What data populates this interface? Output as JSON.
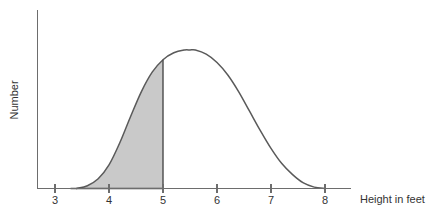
{
  "chart_data": {
    "type": "area",
    "title": "",
    "subtitle": "",
    "xlabel": "Height in feet",
    "ylabel": "Number",
    "x_ticks": [
      3,
      4,
      5,
      6,
      7,
      8
    ],
    "x_tick_labels": [
      "3",
      "4",
      "5",
      "6",
      "7",
      "8"
    ],
    "xlim": [
      2.6,
      8.5
    ],
    "ylim": [
      0,
      1.12
    ],
    "y_ticks": [],
    "y_tick_labels": [],
    "grid": false,
    "legend": null,
    "annotations": [],
    "series": [
      {
        "name": "Height distribution",
        "description": "Bell-shaped normal-like distribution of heights",
        "peak_x": 5.5,
        "peak_y": 1.0,
        "left_tail_x": 3.5,
        "right_tail_x": 7.85,
        "x": [
          3.4,
          3.6,
          3.8,
          4.0,
          4.2,
          4.4,
          4.6,
          4.8,
          5.0,
          5.2,
          5.4,
          5.5,
          5.6,
          5.8,
          6.0,
          6.2,
          6.4,
          6.6,
          6.8,
          7.0,
          7.2,
          7.4,
          7.6,
          7.8,
          8.0
        ],
        "y": [
          0.0,
          0.02,
          0.07,
          0.17,
          0.33,
          0.52,
          0.7,
          0.84,
          0.93,
          0.98,
          1.0,
          1.0,
          1.0,
          0.97,
          0.91,
          0.82,
          0.7,
          0.56,
          0.42,
          0.29,
          0.18,
          0.1,
          0.04,
          0.01,
          0.0
        ]
      }
    ],
    "shaded_area": {
      "label": "shaded region",
      "from_x": 3.4,
      "to_x": 5.0,
      "color": "#c9c9c9",
      "boundary_x": 5.0
    },
    "colors": {
      "curve": "#5a5a5a",
      "axis": "#6d6d6d",
      "shade_fill": "#c9c9c9",
      "shade_edge": "#4a4a4a",
      "background": "#ffffff",
      "text": "#333333"
    }
  },
  "labels": {
    "x_axis_title": "Height in feet",
    "y_axis_title": "Number",
    "tick_3": "3",
    "tick_4": "4",
    "tick_5": "5",
    "tick_6": "6",
    "tick_7": "7",
    "tick_8": "8"
  }
}
